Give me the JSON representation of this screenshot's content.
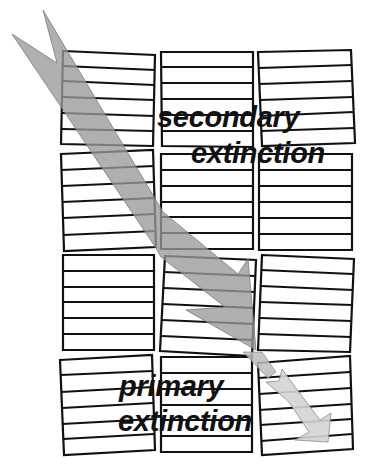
{
  "diagram": {
    "title": "",
    "labels": {
      "secondary_line1": "secondary",
      "secondary_line2": "extinction",
      "primary_line1": "primary",
      "primary_line2": "extinction"
    },
    "colors": {
      "background": "#ffffff",
      "block_stroke": "#111111",
      "beam_main": "#a9a9a9",
      "beam_secondary": "#cfcfcf",
      "beam_stroke": "#8a8a8a",
      "text": "#111111"
    },
    "grid": {
      "rows": 4,
      "columns": 3,
      "lines_per_block": 6,
      "description": "mosaic crystal blocks, each slightly tilted, with horizontal lattice planes"
    },
    "arrows": [
      {
        "name": "incident-beam",
        "description": "large gray double-tailed arrow entering from top-left, passing diagonally through blocks"
      },
      {
        "name": "diffracted-beam",
        "description": "smaller lighter arrow continuing to bottom-right"
      }
    ]
  }
}
